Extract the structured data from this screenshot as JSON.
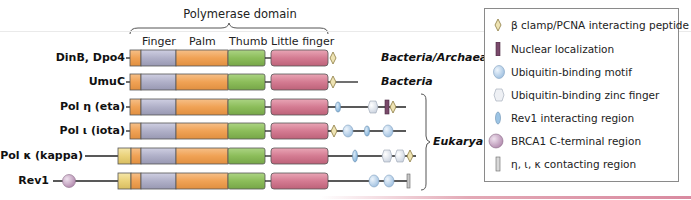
{
  "header": {
    "title": "Polymerase domain",
    "columns": [
      "Finger",
      "Palm",
      "Thumb",
      "Little finger"
    ]
  },
  "colors": {
    "n_term_orange": "#f0a860",
    "n_term_yellow": "#eed98a",
    "finger": "#b3b3cc",
    "palm": "#f2a55e",
    "thumb": "#8fbf60",
    "little_finger": "#d57e94",
    "pcna_peptide": "#eee3b3",
    "nuclear_localization": "#7a4a6b",
    "ubiquitin_binding_motif": "#bcd4ea",
    "ubiquitin_zinc_finger": "#e8ecf2",
    "rev1_interacting": "#9cc4e4",
    "brca1": "#c9a9c4",
    "contacting_region": "#c8c8c8"
  },
  "rows": [
    {
      "label": "DinB, Dpo4",
      "kingdom": "Bacteria/Archaea"
    },
    {
      "label": "UmuC",
      "kingdom": "Bacteria"
    },
    {
      "label": "Pol η (eta)"
    },
    {
      "label": "Pol ι (iota)"
    },
    {
      "label": "Pol κ (kappa)"
    },
    {
      "label": "Rev1"
    }
  ],
  "eukarya_label": "Eukarya",
  "legend": {
    "items": [
      {
        "icon": "diamond-icon",
        "label": "β clamp/PCNA interacting peptide"
      },
      {
        "icon": "bar-icon",
        "label": "Nuclear localization"
      },
      {
        "icon": "oval-icon",
        "label": "Ubiquitin-binding motif"
      },
      {
        "icon": "hexagon-icon",
        "label": "Ubiquitin-binding zinc finger"
      },
      {
        "icon": "ellipse-icon",
        "label": "Rev1 interacting region"
      },
      {
        "icon": "sphere-icon",
        "label": "BRCA1 C-terminal region"
      },
      {
        "icon": "rect-icon",
        "label": "η, ι, κ contacting region"
      }
    ]
  }
}
